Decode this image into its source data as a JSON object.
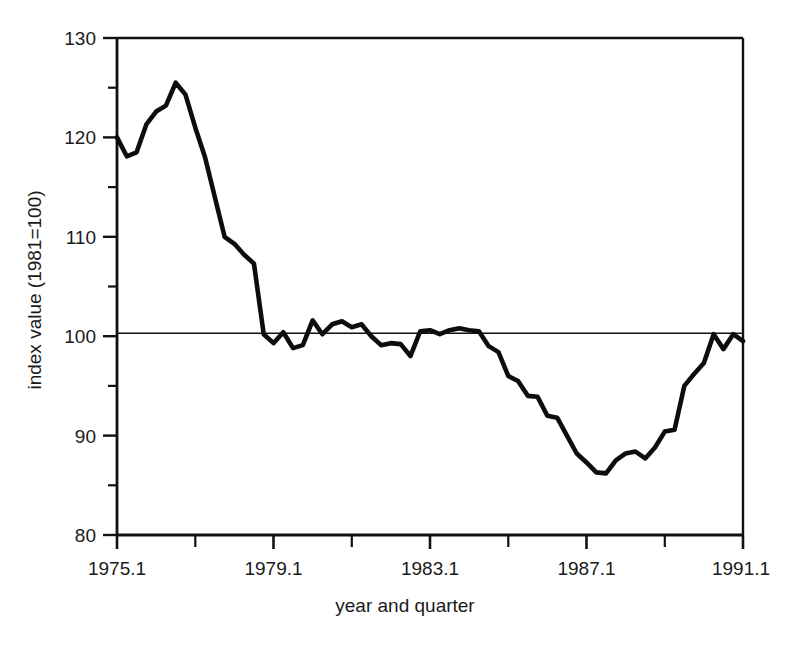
{
  "figure": {
    "background_color": "#ffffff",
    "line_color": "#0d0d0d",
    "axis_color": "#111111"
  },
  "axis": {
    "x_title": "year and quarter",
    "y_title": "index value (1981=100)",
    "y_tick_labels": [
      "130",
      "120",
      "110",
      "100",
      "90",
      "80"
    ],
    "x_tick_labels": [
      "1975.1",
      "1979.1",
      "1983.1",
      "1987.1",
      "1991.1"
    ]
  },
  "chart_data": {
    "type": "line",
    "title": "",
    "xlabel": "year and quarter",
    "ylabel": "index value (1981=100)",
    "xlim": [
      1975.0,
      1991.0
    ],
    "ylim": [
      80,
      130
    ],
    "grid": false,
    "legend": "none",
    "y_major_ticks": [
      80,
      90,
      100,
      110,
      120,
      130
    ],
    "y_minor_ticks": [
      85,
      95,
      105,
      115,
      125
    ],
    "x_major_ticks": [
      1975.0,
      1977.0,
      1979.0,
      1981.0,
      1983.0,
      1985.0,
      1987.0,
      1989.0,
      1991.0
    ],
    "x_labeled_ticks": [
      1975.0,
      1979.0,
      1983.0,
      1987.0,
      1991.0
    ],
    "reference_line_y": 100.3,
    "x_tick_interval_years": 2,
    "x_label_interval_years": 4,
    "series": [
      {
        "name": "index value",
        "color": "#0d0d0d",
        "x": [
          1975.0,
          1975.25,
          1975.5,
          1975.75,
          1976.0,
          1976.25,
          1976.5,
          1976.75,
          1977.0,
          1977.25,
          1977.5,
          1977.75,
          1978.0,
          1978.25,
          1978.5,
          1978.75,
          1979.0,
          1979.25,
          1979.5,
          1979.75,
          1980.0,
          1980.25,
          1980.5,
          1980.75,
          1981.0,
          1981.25,
          1981.5,
          1981.75,
          1982.0,
          1982.25,
          1982.5,
          1982.75,
          1983.0,
          1983.25,
          1983.5,
          1983.75,
          1984.0,
          1984.25,
          1984.5,
          1984.75,
          1985.0,
          1985.25,
          1985.5,
          1985.75,
          1986.0,
          1986.25,
          1986.5,
          1986.75,
          1987.0,
          1987.25,
          1987.5,
          1987.75,
          1988.0,
          1988.25,
          1988.5,
          1988.75,
          1989.0,
          1989.25,
          1989.5,
          1989.75,
          1990.0,
          1990.25,
          1990.5,
          1990.75,
          1991.0
        ],
        "y": [
          120.0,
          118.1,
          118.5,
          121.3,
          122.6,
          123.2,
          125.5,
          124.3,
          121.0,
          118.0,
          114.0,
          110.0,
          109.3,
          108.2,
          107.3,
          100.2,
          99.3,
          100.4,
          98.8,
          99.1,
          101.6,
          100.2,
          101.2,
          101.5,
          100.9,
          101.2,
          100.0,
          99.1,
          99.3,
          99.2,
          98.0,
          100.5,
          100.6,
          100.2,
          100.6,
          100.8,
          100.6,
          100.5,
          99.0,
          98.4,
          96.0,
          95.5,
          94.0,
          93.9,
          92.0,
          91.8,
          90.0,
          88.2,
          87.3,
          86.3,
          86.2,
          87.5,
          88.2,
          88.4,
          87.7,
          88.8,
          90.4,
          90.6,
          95.0,
          96.2,
          97.3,
          100.2,
          98.7,
          100.2,
          99.5
        ]
      }
    ],
    "annotations": [
      {
        "label": "series start",
        "x": 1975.0,
        "y": 120.0
      },
      {
        "label": "peak",
        "x": 1976.5,
        "y": 125.5
      },
      {
        "label": "trough",
        "x": 1987.5,
        "y": 86.2
      },
      {
        "label": "series end",
        "x": 1991.0,
        "y": 99.5
      }
    ]
  }
}
